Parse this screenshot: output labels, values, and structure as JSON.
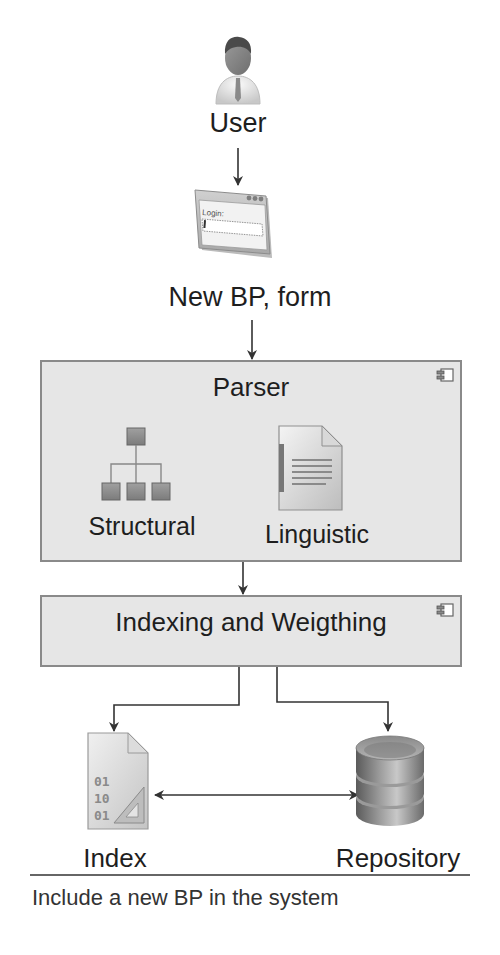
{
  "diagram": {
    "nodes": {
      "user": {
        "label": "User",
        "icon": "user-icon"
      },
      "form": {
        "label": "New BP, form",
        "icon": "login-form-icon",
        "icon_text": "Login:"
      },
      "parser": {
        "title": "Parser",
        "icon": "component-icon",
        "children": [
          {
            "label": "Structural",
            "icon": "hierarchy-icon"
          },
          {
            "label": "Linguistic",
            "icon": "document-icon"
          }
        ]
      },
      "indexing": {
        "title": "Indexing and Weigthing",
        "icon": "component-icon"
      },
      "index": {
        "label": "Index",
        "icon": "binary-file-icon",
        "icon_text": [
          "01",
          "10",
          "01"
        ]
      },
      "repository": {
        "label": "Repository",
        "icon": "database-icon"
      }
    },
    "edges": [
      {
        "from": "User",
        "to": "New BP, form",
        "type": "arrow"
      },
      {
        "from": "New BP, form",
        "to": "Parser",
        "type": "arrow"
      },
      {
        "from": "Parser",
        "to": "Indexing and Weigthing",
        "type": "arrow"
      },
      {
        "from": "Indexing and Weigthing",
        "to": "Index",
        "type": "arrow"
      },
      {
        "from": "Indexing and Weigthing",
        "to": "Repository",
        "type": "arrow"
      },
      {
        "from": "Index",
        "to": "Repository",
        "type": "bidirectional"
      }
    ],
    "caption": "Include a new BP in the system"
  },
  "colors": {
    "box_fill": "#e6e6e6",
    "box_border": "#8a8a8a",
    "line": "#333333",
    "text": "#1e1e1e"
  }
}
